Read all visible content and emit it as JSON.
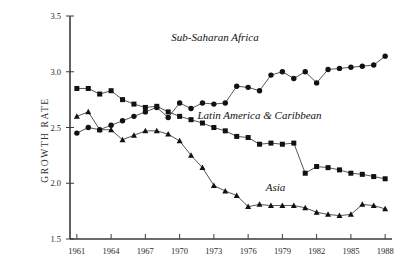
{
  "chart_data": {
    "type": "line",
    "title": "",
    "xlabel": "",
    "ylabel": "GROWTH RATE",
    "xlim": [
      1960.4,
      1988.6
    ],
    "ylim": [
      1.5,
      3.5
    ],
    "yticks": [
      "1.5",
      "2.0",
      "2.5",
      "3.0",
      "3.5"
    ],
    "ytick_values": [
      1.5,
      2.0,
      2.5,
      3.0,
      3.5
    ],
    "xticks": [
      "1961",
      "1964",
      "1967",
      "1970",
      "1973",
      "1976",
      "1979",
      "1982",
      "1985",
      "1988"
    ],
    "xtick_values": [
      1961,
      1964,
      1967,
      1970,
      1973,
      1976,
      1979,
      1982,
      1985,
      1988
    ],
    "grid": false,
    "legend_position": "inline-annotations",
    "x": [
      1961,
      1962,
      1963,
      1964,
      1965,
      1966,
      1967,
      1968,
      1969,
      1970,
      1971,
      1972,
      1973,
      1974,
      1975,
      1976,
      1977,
      1978,
      1979,
      1980,
      1981,
      1982,
      1983,
      1984,
      1985,
      1986,
      1987,
      1988
    ],
    "series": [
      {
        "name": "Sub-Saharan Africa",
        "marker": "circle",
        "color": "#111111",
        "label_x": 1973.1,
        "label_y": 3.28,
        "values": [
          2.45,
          2.5,
          2.48,
          2.52,
          2.56,
          2.6,
          2.64,
          2.68,
          2.59,
          2.72,
          2.67,
          2.72,
          2.71,
          2.72,
          2.87,
          2.86,
          2.83,
          2.97,
          3.0,
          2.94,
          3.0,
          2.9,
          3.02,
          3.03,
          3.04,
          3.05,
          3.06,
          3.14
        ]
      },
      {
        "name": "Latin America & Caribbean",
        "marker": "square",
        "color": "#111111",
        "label_x": 1977.0,
        "label_y": 2.58,
        "values": [
          2.85,
          2.85,
          2.8,
          2.83,
          2.75,
          2.71,
          2.68,
          2.69,
          2.64,
          2.6,
          2.57,
          2.54,
          2.5,
          2.47,
          2.42,
          2.41,
          2.35,
          2.36,
          2.35,
          2.36,
          2.09,
          2.15,
          2.14,
          2.12,
          2.09,
          2.08,
          2.06,
          2.04
        ]
      },
      {
        "name": "Asia",
        "marker": "triangle",
        "color": "#111111",
        "label_x": 1978.4,
        "label_y": 1.93,
        "values": [
          2.6,
          2.64,
          2.48,
          2.48,
          2.39,
          2.43,
          2.47,
          2.47,
          2.44,
          2.38,
          2.25,
          2.14,
          1.98,
          1.93,
          1.89,
          1.79,
          1.81,
          1.8,
          1.8,
          1.8,
          1.78,
          1.74,
          1.72,
          1.71,
          1.72,
          1.81,
          1.8,
          1.77
        ]
      }
    ]
  }
}
